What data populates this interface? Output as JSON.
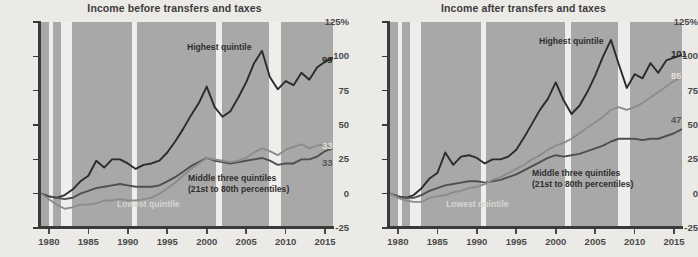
{
  "figure": {
    "background_color": "#eceae7",
    "plot_background_color": "#a8a8a8",
    "recession_band_color": "#f0eeeb"
  },
  "panels": [
    {
      "id": "before",
      "title": "Income before transfers and taxes",
      "annotations": [
        {
          "name": "highest-quintile-label",
          "text": "Highest quintile",
          "style": "dark"
        },
        {
          "name": "middle-three-quintiles-label",
          "text": "Middle three quintiles",
          "style": "dark"
        },
        {
          "name": "middle-three-quintiles-sublabel",
          "text": "(21st to 80th percentiles)",
          "style": "dark"
        },
        {
          "name": "lowest-quintile-label",
          "text": "Lowest quintile",
          "style": "light"
        }
      ],
      "end_labels": [
        {
          "name": "end-label-highest",
          "text": "99",
          "style": "dark"
        },
        {
          "name": "end-label-lowest",
          "text": "33",
          "style": "light"
        },
        {
          "name": "end-label-middle",
          "text": "33",
          "style": "mid"
        }
      ]
    },
    {
      "id": "after",
      "title": "Income after transfers and taxes",
      "annotations": [
        {
          "name": "highest-quintile-label",
          "text": "Highest quintile",
          "style": "dark"
        },
        {
          "name": "middle-three-quintiles-label",
          "text": "Middle three quintiles",
          "style": "dark"
        },
        {
          "name": "middle-three-quintiles-sublabel",
          "text": "(21st to 80th percentiles)",
          "style": "dark"
        },
        {
          "name": "lowest-quintile-label",
          "text": "Lowest quintile",
          "style": "light"
        }
      ],
      "end_labels": [
        {
          "name": "end-label-highest",
          "text": "101",
          "style": "dark"
        },
        {
          "name": "end-label-lowest",
          "text": "85",
          "style": "light"
        },
        {
          "name": "end-label-middle",
          "text": "47",
          "style": "mid"
        }
      ]
    }
  ],
  "axes": {
    "y_ticks": [
      "125%",
      "100",
      "75",
      "50",
      "25",
      "0",
      "-25"
    ],
    "y_values": [
      125,
      100,
      75,
      50,
      25,
      0,
      -25
    ],
    "ylim": [
      -25,
      125
    ],
    "x_ticks": [
      "1980",
      "1985",
      "1990",
      "1995",
      "2000",
      "2005",
      "2010",
      "2015"
    ],
    "x_values": [
      1980,
      1985,
      1990,
      1995,
      2000,
      2005,
      2010,
      2015
    ],
    "xlim": [
      1979,
      2016
    ]
  },
  "chart_data": {
    "type": "line",
    "xlabel": "",
    "ylabel": "",
    "ylim": [
      -25,
      125
    ],
    "xlim": [
      1979,
      2016
    ],
    "grid": false,
    "legend": "inline-annotations",
    "x": [
      1979,
      1980,
      1981,
      1982,
      1983,
      1984,
      1985,
      1986,
      1987,
      1988,
      1989,
      1990,
      1991,
      1992,
      1993,
      1994,
      1995,
      1996,
      1997,
      1998,
      1999,
      2000,
      2001,
      2002,
      2003,
      2004,
      2005,
      2006,
      2007,
      2008,
      2009,
      2010,
      2011,
      2012,
      2013,
      2014,
      2015,
      2016
    ],
    "recession_bands": [
      {
        "start": 1980.0,
        "end": 1980.55
      },
      {
        "start": 1981.55,
        "end": 1982.9
      },
      {
        "start": 1990.55,
        "end": 1991.2
      },
      {
        "start": 2001.2,
        "end": 2001.9
      },
      {
        "start": 2007.95,
        "end": 2009.45
      }
    ],
    "panels": [
      {
        "name": "Income before transfers and taxes",
        "series": [
          {
            "name": "Highest quintile",
            "color": "#2b2b2b",
            "end_value": 99,
            "values": [
              0,
              -2,
              -3,
              -1,
              3,
              9,
              13,
              24,
              19,
              25,
              25,
              22,
              18,
              21,
              22,
              24,
              30,
              38,
              47,
              57,
              66,
              78,
              63,
              56,
              60,
              70,
              81,
              95,
              104,
              85,
              76,
              82,
              79,
              88,
              83,
              92,
              96,
              99
            ]
          },
          {
            "name": "Middle three quintiles",
            "color": "#4f4f4f",
            "end_value": 33,
            "values": [
              0,
              -2,
              -3,
              -4,
              -3,
              0,
              2,
              4,
              5,
              6,
              7,
              6,
              5,
              5,
              5,
              6,
              9,
              12,
              16,
              20,
              23,
              26,
              24,
              23,
              22,
              23,
              24,
              25,
              26,
              24,
              21,
              22,
              22,
              25,
              25,
              27,
              31,
              33
            ]
          },
          {
            "name": "Lowest quintile",
            "color": "#8c8c8c",
            "end_value": 33,
            "values": [
              0,
              -4,
              -8,
              -11,
              -10,
              -8,
              -8,
              -7,
              -5,
              -5,
              -4,
              -5,
              -5,
              -4,
              -3,
              0,
              4,
              8,
              13,
              18,
              22,
              26,
              25,
              24,
              23,
              24,
              26,
              30,
              33,
              31,
              28,
              32,
              34,
              36,
              33,
              35,
              36,
              33
            ]
          }
        ]
      },
      {
        "name": "Income after transfers and taxes",
        "series": [
          {
            "name": "Highest quintile",
            "color": "#2b2b2b",
            "end_value": 101,
            "values": [
              0,
              -2,
              -3,
              -1,
              4,
              11,
              15,
              30,
              21,
              27,
              28,
              26,
              22,
              25,
              25,
              27,
              32,
              41,
              51,
              61,
              69,
              81,
              68,
              58,
              64,
              74,
              86,
              100,
              112,
              94,
              77,
              87,
              84,
              95,
              88,
              97,
              99,
              101
            ]
          },
          {
            "name": "Middle three quintiles",
            "color": "#4f4f4f",
            "end_value": 47,
            "values": [
              0,
              -2,
              -3,
              -3,
              -1,
              2,
              4,
              6,
              7,
              8,
              9,
              9,
              8,
              9,
              10,
              12,
              14,
              17,
              20,
              23,
              26,
              28,
              27,
              28,
              29,
              31,
              33,
              35,
              38,
              40,
              40,
              40,
              39,
              40,
              40,
              42,
              44,
              47
            ]
          },
          {
            "name": "Lowest quintile",
            "color": "#8c8c8c",
            "end_value": 85,
            "values": [
              0,
              -3,
              -5,
              -6,
              -6,
              -3,
              -2,
              -1,
              1,
              2,
              4,
              5,
              7,
              10,
              12,
              15,
              18,
              21,
              25,
              28,
              32,
              35,
              37,
              40,
              44,
              48,
              52,
              56,
              61,
              63,
              61,
              63,
              66,
              70,
              74,
              78,
              82,
              85
            ]
          }
        ]
      }
    ]
  }
}
